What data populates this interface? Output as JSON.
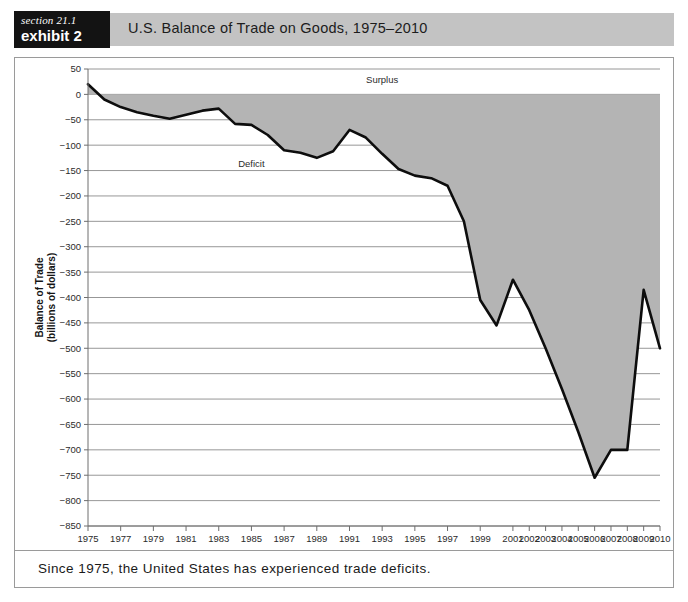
{
  "header": {
    "section_label": "section 21.1",
    "exhibit_label": "exhibit 2",
    "title": "U.S. Balance of Trade on Goods, 1975–2010"
  },
  "caption": {
    "text": "Since 1975, the United States has experienced trade deficits."
  },
  "colors": {
    "header_band": "#c3c3c3",
    "tag_background": "#131313",
    "area_fill": "#b4b4b4",
    "line_stroke": "#0d0d0d",
    "grid": "#8b8b8b"
  },
  "chart_data": {
    "type": "area",
    "title": "U.S. Balance of Trade on Goods, 1975–2010",
    "xlabel": "Year",
    "ylabel": "Balance of Trade (billions of dollars)",
    "ylim": [
      -850,
      50
    ],
    "ytick_step": 50,
    "grid": true,
    "legend_position": "none",
    "baseline": 0,
    "ytick_labels": [
      "50",
      "0",
      "−50",
      "−100",
      "−150",
      "−200",
      "−250",
      "−300",
      "−350",
      "−400",
      "−450",
      "−500",
      "−550",
      "−600",
      "−650",
      "−700",
      "−750",
      "−800",
      "−850"
    ],
    "ytick_values": [
      50,
      0,
      -50,
      -100,
      -150,
      -200,
      -250,
      -300,
      -350,
      -400,
      -450,
      -500,
      -550,
      -600,
      -650,
      -700,
      -750,
      -800,
      -850
    ],
    "xtick_labels": [
      "1975",
      "1977",
      "1979",
      "1981",
      "1983",
      "1985",
      "1987",
      "1989",
      "1991",
      "1993",
      "1995",
      "1997",
      "1999",
      "2001",
      "2002",
      "2003",
      "2004",
      "2005",
      "2006",
      "2007",
      "2008",
      "2009",
      "2010"
    ],
    "categories": [
      "1975",
      "1976",
      "1977",
      "1978",
      "1979",
      "1980",
      "1981",
      "1982",
      "1983",
      "1984",
      "1985",
      "1986",
      "1987",
      "1988",
      "1989",
      "1990",
      "1991",
      "1992",
      "1993",
      "1994",
      "1995",
      "1996",
      "1997",
      "1998",
      "1999",
      "2000",
      "2001",
      "2002",
      "2003",
      "2004",
      "2005",
      "2006",
      "2007",
      "2008",
      "2009",
      "2010"
    ],
    "values": [
      20,
      -10,
      -25,
      -35,
      -42,
      -48,
      -40,
      -32,
      -28,
      -58,
      -60,
      -80,
      -110,
      -115,
      -125,
      -112,
      -70,
      -85,
      -117,
      -147,
      -160,
      -165,
      -180,
      -250,
      -405,
      -455,
      -365,
      -425,
      -500,
      -580,
      -665,
      -755,
      -700,
      -700,
      -385,
      -500
    ],
    "annotations": [
      {
        "text": "Surplus",
        "x_category": "1993",
        "y_value": 22
      },
      {
        "text": "Deficit",
        "x_category": "1985",
        "y_value": -143
      }
    ]
  }
}
